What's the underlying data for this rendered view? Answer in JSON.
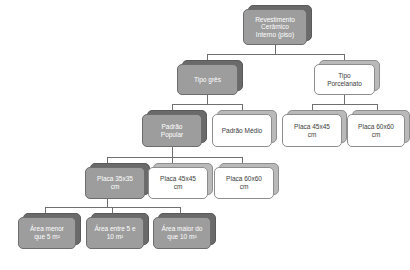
{
  "diagram": {
    "type": "tree-hierarchy",
    "title": "Revestimento Cerâmico Interno (piso)",
    "accent_shaded": "#9d9d9d",
    "accent_plain": "#ffffff",
    "line_color": "#6f6f6f",
    "nodes": {
      "root": "Revestimento\nCerâmico\nInterno (piso)",
      "tipo_gres": "Tipo grês",
      "tipo_porcelanato": "Tipo\nPorcelanato",
      "padrao_popular": "Padrão\nPopular",
      "padrao_medio": "Padrão Médio",
      "porc_placa_45": "Placa 45x45\ncm",
      "porc_placa_60": "Placa 60x60\ncm",
      "pop_placa_35": "Placa 35x35\ncm",
      "pop_placa_45": "Placa 45x45\ncm",
      "pop_placa_60": "Placa 60x60\ncm",
      "area_menor_5": "Área menor\nque 5 m²",
      "area_entre_5_10": "Área entre 5 e\n10 m²",
      "area_maior_10": "Área maior do\nque 10 m²"
    }
  }
}
